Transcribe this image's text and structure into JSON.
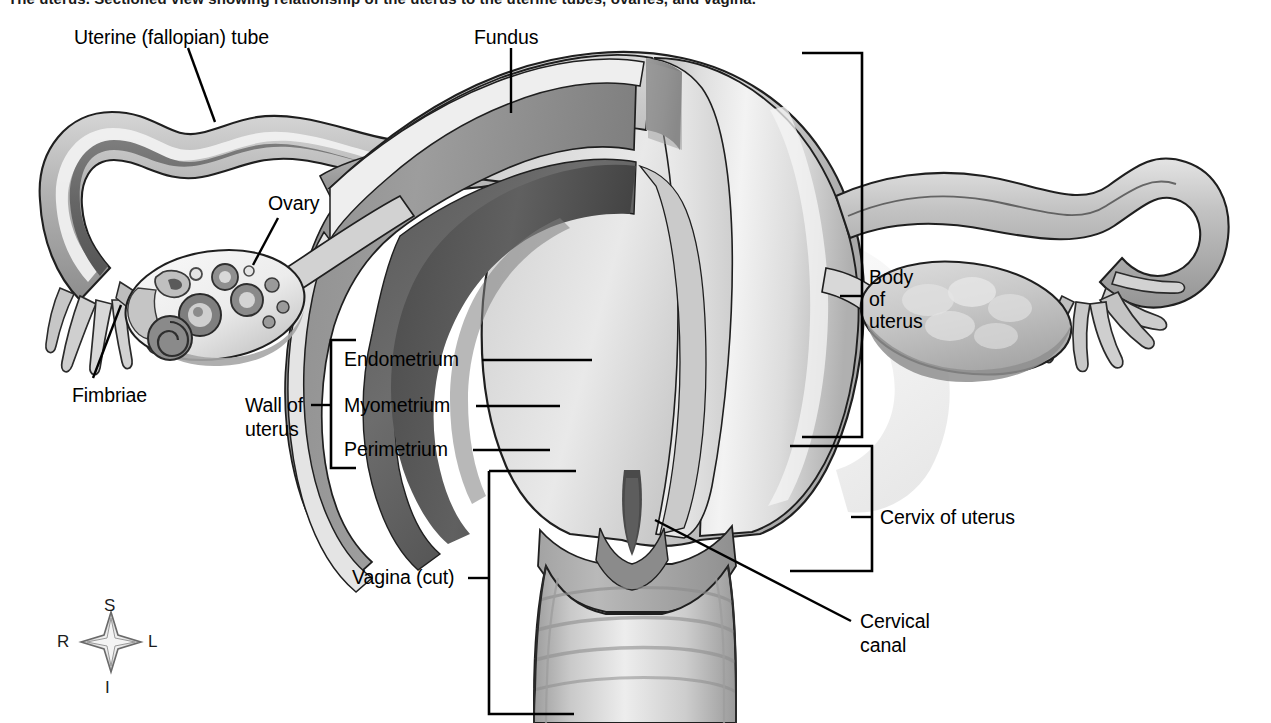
{
  "figure": {
    "caption": "The uterus. Sectioned view showing relationship of the uterus to the uterine tubes, ovaries, and vagina.",
    "background_color": "#ffffff",
    "line_color": "#000000"
  },
  "labels": {
    "uterine_tube": "Uterine (fallopian) tube",
    "fundus": "Fundus",
    "ovary": "Ovary",
    "fimbriae": "Fimbriae",
    "wall_of_uterus_line1": "Wall of",
    "wall_of_uterus_line2": "uterus",
    "endometrium": "Endometrium",
    "myometrium": "Myometrium",
    "perimetrium": "Perimetrium",
    "vagina_cut": "Vagina (cut)",
    "body_of_uterus_line1": "Body",
    "body_of_uterus_line2": "of",
    "body_of_uterus_line3": "uterus",
    "cervix_of_uterus": "Cervix of uterus",
    "cervical_canal_line1": "Cervical",
    "cervical_canal_line2": "canal"
  },
  "orientation_key": {
    "superior": "S",
    "inferior": "I",
    "right": "R",
    "left": "L"
  },
  "palette": {
    "outline": "#1a1a1a",
    "perimetrium_light": "#e8e8e8",
    "myometrium_mid": "#9c9c9c",
    "endometrium_dark": "#6a6a6a",
    "cavity_shadow": "#4f4f4f",
    "highlight": "#f4f4f4",
    "tube_lumen": "#6e6e6e",
    "ovary_fill": "#f2f2f2",
    "ovary_shadow": "#a8a8a8"
  }
}
